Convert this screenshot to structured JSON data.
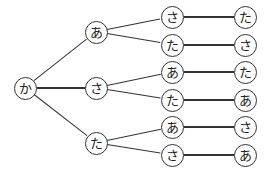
{
  "tree": {
    "root": {
      "id": "n0",
      "label": "か",
      "x": 25,
      "y": 88
    },
    "nodes": [
      {
        "id": "n1",
        "label": "あ",
        "x": 96,
        "y": 32,
        "parent": "n0"
      },
      {
        "id": "n2",
        "label": "さ",
        "x": 96,
        "y": 88,
        "parent": "n0"
      },
      {
        "id": "n3",
        "label": "た",
        "x": 96,
        "y": 143,
        "parent": "n0"
      },
      {
        "id": "n4",
        "label": "さ",
        "x": 172,
        "y": 17,
        "parent": "n1"
      },
      {
        "id": "n5",
        "label": "た",
        "x": 172,
        "y": 45,
        "parent": "n1"
      },
      {
        "id": "n6",
        "label": "あ",
        "x": 172,
        "y": 72,
        "parent": "n2"
      },
      {
        "id": "n7",
        "label": "た",
        "x": 172,
        "y": 100,
        "parent": "n2"
      },
      {
        "id": "n8",
        "label": "あ",
        "x": 172,
        "y": 127,
        "parent": "n3"
      },
      {
        "id": "n9",
        "label": "さ",
        "x": 172,
        "y": 155,
        "parent": "n3"
      },
      {
        "id": "n10",
        "label": "た",
        "x": 245,
        "y": 17,
        "parent": "n4"
      },
      {
        "id": "n11",
        "label": "さ",
        "x": 245,
        "y": 45,
        "parent": "n5"
      },
      {
        "id": "n12",
        "label": "た",
        "x": 245,
        "y": 72,
        "parent": "n6"
      },
      {
        "id": "n13",
        "label": "あ",
        "x": 245,
        "y": 100,
        "parent": "n7"
      },
      {
        "id": "n14",
        "label": "さ",
        "x": 245,
        "y": 127,
        "parent": "n8"
      },
      {
        "id": "n15",
        "label": "あ",
        "x": 245,
        "y": 155,
        "parent": "n9"
      }
    ],
    "paths": [
      [
        "か",
        "あ",
        "さ",
        "た"
      ],
      [
        "か",
        "あ",
        "た",
        "さ"
      ],
      [
        "か",
        "さ",
        "あ",
        "た"
      ],
      [
        "か",
        "さ",
        "た",
        "あ"
      ],
      [
        "か",
        "た",
        "あ",
        "さ"
      ],
      [
        "か",
        "た",
        "さ",
        "あ"
      ]
    ]
  }
}
